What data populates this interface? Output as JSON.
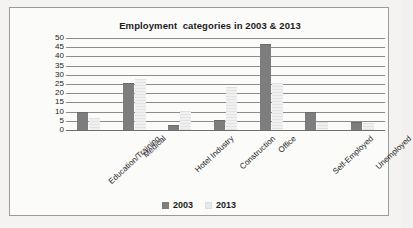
{
  "chart_data": {
    "type": "bar",
    "title": "Employment  categories in 2003 & 2013",
    "xlabel": "",
    "ylabel": "",
    "ylim": [
      0,
      50
    ],
    "ytick_step": 5,
    "yticks": [
      "50",
      "45",
      "40",
      "35",
      "30",
      "25",
      "20",
      "15",
      "10",
      "5",
      "0"
    ],
    "grid": true,
    "legend_position": "bottom",
    "categories": [
      "Education/Training",
      "Medical",
      "Hotel Industry",
      "Construction",
      "Office",
      "Self-Employed",
      "Unemployed"
    ],
    "series": [
      {
        "name": "2003",
        "color": "#7d7d7d",
        "values": [
          9,
          25,
          2,
          5,
          46,
          9,
          4
        ]
      },
      {
        "name": "2013",
        "color": "#ededed",
        "values": [
          6,
          27,
          10,
          23,
          25,
          4,
          3
        ]
      }
    ]
  },
  "legend": {
    "items": [
      {
        "label": "2003"
      },
      {
        "label": "2013"
      }
    ]
  }
}
